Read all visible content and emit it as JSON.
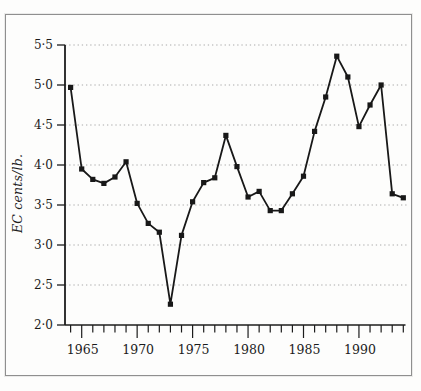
{
  "figure": {
    "border_color": "#8f8f8f",
    "background": "#fdfdfc"
  },
  "chart_data": {
    "type": "line",
    "title": "",
    "xlabel": "",
    "ylabel": "EC cents/lb.",
    "x": [
      1964,
      1965,
      1966,
      1967,
      1968,
      1969,
      1970,
      1971,
      1972,
      1973,
      1974,
      1975,
      1976,
      1977,
      1978,
      1979,
      1980,
      1981,
      1982,
      1983,
      1984,
      1985,
      1986,
      1987,
      1988,
      1989,
      1990,
      1991,
      1992,
      1993,
      1994
    ],
    "values": [
      4.97,
      3.95,
      3.82,
      3.77,
      3.85,
      4.04,
      3.52,
      3.27,
      3.16,
      2.26,
      3.12,
      3.54,
      3.78,
      3.84,
      4.37,
      3.98,
      3.6,
      3.67,
      3.43,
      3.43,
      3.64,
      3.86,
      4.42,
      4.85,
      5.36,
      5.1,
      4.48,
      4.75,
      5.0,
      3.64,
      3.59
    ],
    "ylim": [
      2.0,
      5.5
    ],
    "xlim": [
      1963.5,
      1994.5
    ],
    "y_ticks": [
      2.0,
      2.5,
      3.0,
      3.5,
      4.0,
      4.5,
      5.0,
      5.5
    ],
    "y_tick_labels": [
      "2·0",
      "2·5",
      "3·0",
      "3·5",
      "4·0",
      "4·5",
      "5·0",
      "5·5"
    ],
    "x_major_ticks": [
      1965,
      1970,
      1975,
      1980,
      1985,
      1990
    ],
    "x_major_tick_labels": [
      "1965",
      "1970",
      "1975",
      "1980",
      "1985",
      "1990"
    ],
    "x_minor_tick_every": 1,
    "grid": "horizontal-dotted",
    "grid_color": "#a9a9a9",
    "legend": "none",
    "line_color": "#181818",
    "marker": "square",
    "axis_color": "#1c1c1c"
  }
}
